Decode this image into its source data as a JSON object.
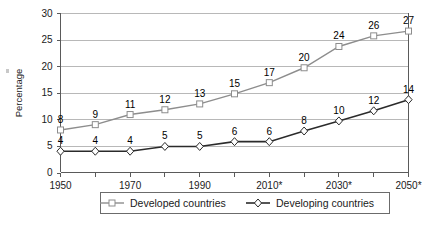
{
  "chart_data": {
    "type": "line",
    "title": "",
    "subtitle": "",
    "xlabel": "",
    "ylabel": "Percentage",
    "x": [
      "1950",
      "1960",
      "1970",
      "1980",
      "1990",
      "2000",
      "2010*",
      "2020",
      "2030*",
      "2040",
      "2050*"
    ],
    "x_tick_labels": [
      "1950",
      "",
      "1970",
      "",
      "1990",
      "",
      "2010*",
      "",
      "2030*",
      "",
      "2050*"
    ],
    "xlim": [
      1950,
      2050
    ],
    "ylim": [
      0,
      30
    ],
    "y_ticks": [
      0,
      5,
      10,
      15,
      20,
      25,
      30
    ],
    "y_tick_labels": [
      "0",
      "5",
      "10",
      "15",
      "20",
      "25",
      "30"
    ],
    "grid": "horizontal",
    "legend_position": "bottom",
    "series": [
      {
        "name": "Developed countries",
        "marker": "square",
        "color": "#8d8d8d",
        "values": [
          8,
          9,
          11,
          12,
          13,
          15,
          17,
          20,
          24,
          26,
          27
        ],
        "plotted": [
          8.0,
          9.0,
          10.9,
          11.8,
          12.9,
          14.8,
          16.9,
          19.7,
          23.7,
          25.7,
          26.6
        ],
        "labels": [
          "8",
          "9",
          "11",
          "12",
          "13",
          "15",
          "17",
          "20",
          "24",
          "26",
          "27"
        ]
      },
      {
        "name": "Developing countries",
        "marker": "diamond",
        "color": "#2b2b2b",
        "values": [
          4,
          4,
          4,
          5,
          5,
          6,
          6,
          8,
          10,
          12,
          14
        ],
        "plotted": [
          4.0,
          4.0,
          4.0,
          4.9,
          4.9,
          5.8,
          5.8,
          7.8,
          9.7,
          11.6,
          13.7
        ],
        "labels": [
          "4",
          "4",
          "4",
          "5",
          "5",
          "6",
          "6",
          "8",
          "10",
          "12",
          "14"
        ]
      }
    ]
  },
  "axes": {
    "y_title": "Percentage"
  },
  "legend": {
    "entries": [
      {
        "label": "Developed countries",
        "marker": "square-marker-icon",
        "color": "#8d8d8d"
      },
      {
        "label": "Developing countries",
        "marker": "diamond-marker-icon",
        "color": "#2b2b2b"
      }
    ]
  },
  "colors": {
    "developed": "#8d8d8d",
    "developing": "#2b2b2b",
    "grid": "#9a9a9a",
    "axis": "#5a5a5a",
    "background": "#ffffff"
  }
}
